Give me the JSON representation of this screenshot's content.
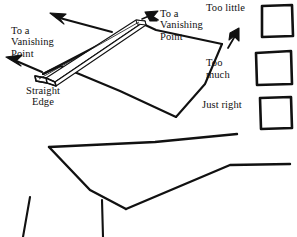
{
  "diagram": {
    "ink_color": "#111111",
    "background_color": "#ffffff",
    "labels": {
      "vanishing_point_left": "To a\nVanishing\nPoint",
      "vanishing_point_right": "To a\nVanishing\nPoint",
      "straight_edge": "Straight\nEdge",
      "too_little": "Too little",
      "too_much": "Too\nmuch",
      "just_right": "Just right"
    },
    "icons": {
      "arrow_up_left": "arrow-up-left-icon",
      "arrow_up_right": "arrow-up-right-icon",
      "arrow_left": "arrow-left-icon"
    },
    "sample_boxes": [
      {
        "name": "too-little",
        "label": "Too little"
      },
      {
        "name": "too-much",
        "label": "Too much"
      },
      {
        "name": "just-right",
        "label": "Just right"
      }
    ]
  }
}
